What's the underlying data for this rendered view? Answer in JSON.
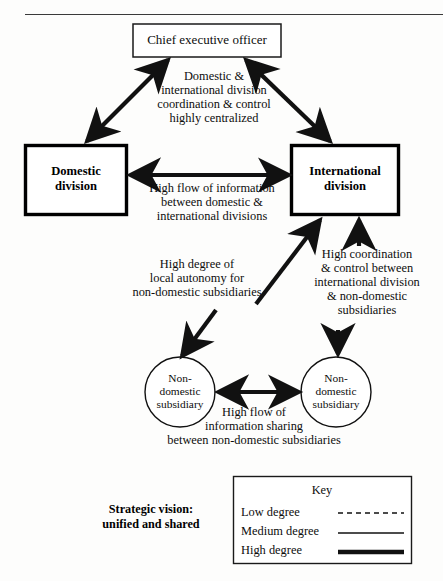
{
  "diagram": {
    "title_rule": "horizontal-rule",
    "nodes": {
      "ceo": {
        "label": "Chief executive officer"
      },
      "domestic": {
        "label": "Domestic\ndivision"
      },
      "international": {
        "label": "International\ndivision"
      },
      "subsidiary_left": {
        "label": "Non-\ndomestic\nsubsidiary"
      },
      "subsidiary_right": {
        "label": "Non-\ndomestic\nsubsidiary"
      }
    },
    "annotations": {
      "ceo_coordination": "Domestic &\ninternational division\ncoordination & control\nhighly centralized",
      "division_flow": "High flow of information\nbetween domestic &\ninternational divisions",
      "local_autonomy": "High degree of\nlocal autonomy for\nnon-domestic subsidiaries",
      "intl_coordination": "High coordination\n& control between\ninternational division\n& non-domestic\nsubsidiaries",
      "subsidiary_flow": "High flow of\ninformation sharing\nbetween non-domestic subsidiaries"
    },
    "strategic_vision": "Strategic vision:\nunified and shared",
    "key": {
      "title": "Key",
      "items": [
        {
          "label": "Low degree",
          "style": "dashed"
        },
        {
          "label": "Medium degree",
          "style": "thin"
        },
        {
          "label": "High degree",
          "style": "thick"
        }
      ]
    },
    "colors": {
      "ink": "#111111",
      "background": "#fdfdfc"
    }
  }
}
